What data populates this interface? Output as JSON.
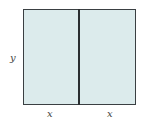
{
  "diagram": {
    "shape": "rectangle divided into two equal parts",
    "fill_color": "#dcebec",
    "stroke_color": "#3a3f42",
    "labels": {
      "height": "y",
      "left_width": "x",
      "right_width": "x"
    }
  }
}
